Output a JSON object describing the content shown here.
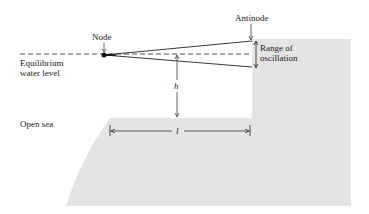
{
  "diagram": {
    "labels": {
      "node": "Node",
      "antinode": "Antinode",
      "equilibrium_line1": "Equilibrium",
      "equilibrium_line2": "water level",
      "range_line1": "Range of",
      "range_line2": "oscillation",
      "open_sea": "Open sea",
      "depth_symbol": "h",
      "length_symbol": "l"
    },
    "colors": {
      "land_fill": "#e4e4e4",
      "line": "#222222",
      "background": "#ffffff"
    }
  }
}
